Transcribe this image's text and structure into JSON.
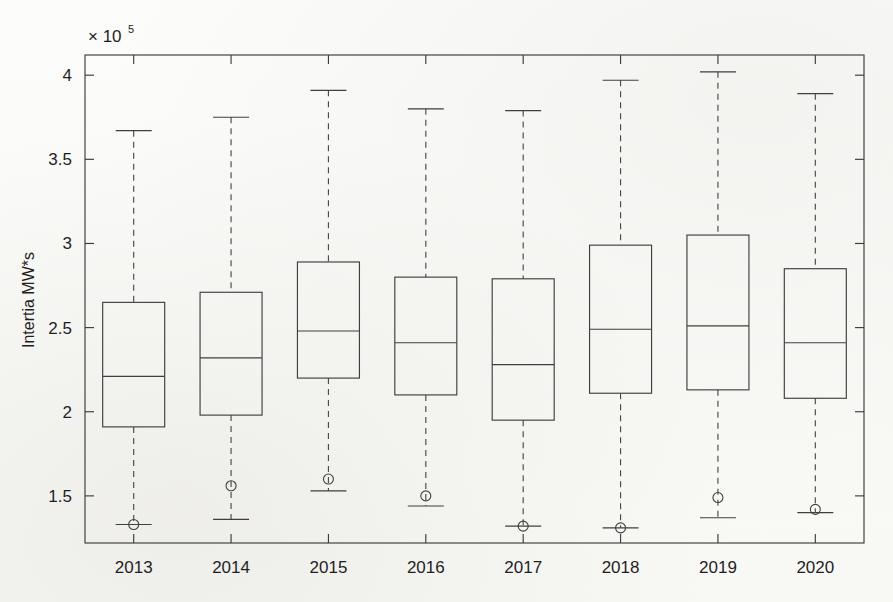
{
  "chart_data": {
    "type": "box",
    "title": "",
    "xlabel": "",
    "ylabel": "Intertia MW*s",
    "y_exponent_label": "× 10",
    "y_exponent_power": "5",
    "y_axis_multiplier": 100000,
    "ylim": [
      1.22,
      4.12
    ],
    "yticks": [
      1.5,
      2,
      2.5,
      3,
      3.5,
      4
    ],
    "ytick_labels": [
      "1.5",
      "2",
      "2.5",
      "3",
      "3.5",
      "4"
    ],
    "grid": false,
    "legend": "none",
    "categories": [
      "2013",
      "2014",
      "2015",
      "2016",
      "2017",
      "2018",
      "2019",
      "2020"
    ],
    "units_note": "values in units of 1e5 MW*s",
    "boxes": [
      {
        "category": "2013",
        "whisker_high": 3.67,
        "q3": 2.65,
        "median": 2.21,
        "q1": 1.91,
        "whisker_low": 1.33,
        "outliers": [
          1.33
        ]
      },
      {
        "category": "2014",
        "whisker_high": 3.75,
        "q3": 2.71,
        "median": 2.32,
        "q1": 1.98,
        "whisker_low": 1.36,
        "outliers": [
          1.56
        ]
      },
      {
        "category": "2015",
        "whisker_high": 3.91,
        "q3": 2.89,
        "median": 2.48,
        "q1": 2.2,
        "whisker_low": 1.53,
        "outliers": [
          1.6
        ]
      },
      {
        "category": "2016",
        "whisker_high": 3.8,
        "q3": 2.8,
        "median": 2.41,
        "q1": 2.1,
        "whisker_low": 1.44,
        "outliers": [
          1.5
        ]
      },
      {
        "category": "2017",
        "whisker_high": 3.79,
        "q3": 2.79,
        "median": 2.28,
        "q1": 1.95,
        "whisker_low": 1.32,
        "outliers": [
          1.32
        ]
      },
      {
        "category": "2018",
        "whisker_high": 3.97,
        "q3": 2.99,
        "median": 2.49,
        "q1": 2.11,
        "whisker_low": 1.31,
        "outliers": [
          1.31
        ]
      },
      {
        "category": "2019",
        "whisker_high": 4.02,
        "q3": 3.05,
        "median": 2.51,
        "q1": 2.13,
        "whisker_low": 1.37,
        "outliers": [
          1.49
        ]
      },
      {
        "category": "2020",
        "whisker_high": 3.89,
        "q3": 2.85,
        "median": 2.41,
        "q1": 2.08,
        "whisker_low": 1.4,
        "outliers": [
          1.42
        ]
      }
    ],
    "colors": {
      "axis": "#3c3c3c",
      "box": "#3f3f3f",
      "whisker": "#4a4a4a",
      "outlier": "#3f3f3f",
      "background": "#fdfdfc"
    }
  }
}
